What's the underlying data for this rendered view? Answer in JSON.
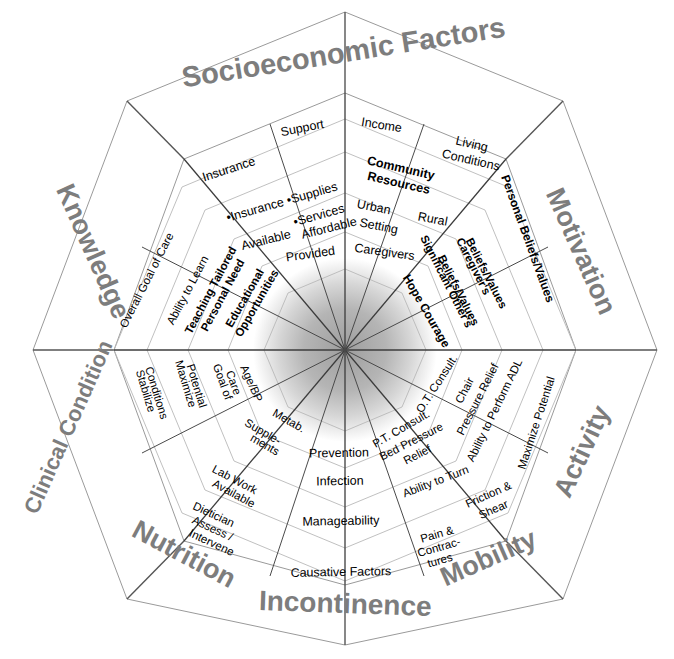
{
  "diagram": {
    "shape": "octagon",
    "center": {
      "x": 345,
      "y": 350
    },
    "colors": {
      "sector_title": "#7d7d7d",
      "cell_text": "#000000",
      "outer_line": "#9a9a9a",
      "divider_line": "#3c3c3c",
      "ring_line": "#b9b9b9",
      "hub_gradient_inner": "#a2a2a2",
      "hub_gradient_outer": "#ffffff",
      "background": "#ffffff"
    },
    "sectors": [
      {
        "id": "socioeconomic-factors",
        "title": "Socioeconomic Factors",
        "angle_deg": -90,
        "columns": [
          {
            "id": "socio-left",
            "cells": [
              "Insurance",
              "•Insurance •Supplies •Services",
              "Available",
              "Provided"
            ]
          },
          {
            "id": "socio-left-inner",
            "cells": [
              "Affordable"
            ]
          },
          {
            "id": "socio-right",
            "cells": [
              "Support",
              "Community Resources",
              "Urban Setting",
              "Caregivers"
            ]
          },
          {
            "id": "socio-right-outer",
            "cells": [
              "Income",
              "Living Conditions",
              "Rural"
            ]
          }
        ]
      },
      {
        "id": "motivation",
        "title": "Motivation",
        "angle_deg": -45,
        "columns": [
          {
            "id": "motivation-cells",
            "cells": [
              "Personal Beliefs/Values",
              "Caregiver's Beliefs/Values",
              "Significant Other's Beliefs/Values",
              "Hope Courage"
            ]
          }
        ]
      },
      {
        "id": "activity",
        "title": "Activity",
        "angle_deg": 0,
        "columns": [
          {
            "id": "activity-cells",
            "cells": [
              "Maximize Potential",
              "Ability to Perform ADL",
              "Chair Pressure Relief",
              "O.T. Consult."
            ]
          }
        ]
      },
      {
        "id": "mobility",
        "title": "Mobility",
        "angle_deg": 45,
        "columns": [
          {
            "id": "mobility-cells",
            "cells": [
              "Friction & Shear",
              "Ability to Turn",
              "Bed Pressure Relief",
              "P.T. Consult.",
              "Pain & Contrac-tures"
            ]
          }
        ]
      },
      {
        "id": "incontinence",
        "title": "Incontinence",
        "angle_deg": 90,
        "columns": [
          {
            "id": "incontinence-cells",
            "cells": [
              "Causative Factors",
              "Manageability",
              "Infection",
              "Prevention"
            ]
          }
        ]
      },
      {
        "id": "nutrition",
        "title": "Nutrition",
        "angle_deg": 135,
        "columns": [
          {
            "id": "nutrition-cells",
            "cells": [
              "Dietician Assess / Intervene",
              "Lab Work Available",
              "Supple-ments",
              "Metab."
            ]
          }
        ]
      },
      {
        "id": "clinical-condition",
        "title": "Clinical Condition",
        "angle_deg": 180,
        "columns": [
          {
            "id": "clinical-cells",
            "cells": [
              "Stabilize Conditions",
              "Maximize Potential",
              "Goal of Care",
              "Age/BP"
            ]
          }
        ]
      },
      {
        "id": "knowledge",
        "title": "Knowledge",
        "angle_deg": -135,
        "columns": [
          {
            "id": "knowledge-cells",
            "cells": [
              "Overall Goal of Care",
              "Ability to Learn",
              "Teaching Tailored Personal Need",
              "Educational Opportunities"
            ]
          }
        ]
      }
    ]
  },
  "labels": {
    "socioeconomic_factors": "Socioeconomic Factors",
    "motivation": "Motivation",
    "activity": "Activity",
    "mobility": "Mobility",
    "incontinence": "Incontinence",
    "nutrition": "Nutrition",
    "clinical_condition": "Clinical Condition",
    "knowledge": "Knowledge",
    "socio_insurance": "Insurance",
    "socio_bullets": "•Insurance •Supplies",
    "socio_bullets2": "•Services",
    "socio_available": "Available",
    "socio_affordable": "Affordable",
    "socio_provided": "Provided",
    "socio_support": "Support",
    "socio_income": "Income",
    "socio_living": "Living",
    "socio_conditions": "Conditions",
    "socio_community": "Community",
    "socio_resources": "Resources",
    "socio_urban": "Urban",
    "socio_setting": "Setting",
    "socio_rural": "Rural",
    "socio_caregivers": "Caregivers",
    "mot_personal": "Personal Beliefs/Values",
    "mot_caregiver1": "Caregiver's",
    "mot_caregiver2": "Beliefs/Values",
    "mot_signif1": "Significant Other's",
    "mot_signif2": "Beliefs/Values",
    "mot_hope": "Hope Courage",
    "act_maximize": "Maximize Potential",
    "act_adl": "Ability to Perform ADL",
    "act_chair1": "Chair",
    "act_chair2": "Pressure Relief",
    "act_ot": "O.T. Consult.",
    "mob_friction1": "Friction &",
    "mob_friction2": "Shear",
    "mob_turn": "Ability to Turn",
    "mob_bed1": "Bed Pressure",
    "mob_bed2": "Relief",
    "mob_pt": "P.T. Consult.",
    "mob_pain1": "Pain &",
    "mob_pain2": "Contrac-",
    "mob_pain3": "tures",
    "inc_causative": "Causative Factors",
    "inc_manage": "Manageability",
    "inc_infection": "Infection",
    "inc_prevention": "Prevention",
    "nut_diet1": "Dietician",
    "nut_diet2": "Assess /",
    "nut_diet3": "Intervene",
    "nut_lab1": "Lab Work",
    "nut_lab2": "Available",
    "nut_supp1": "Supple-",
    "nut_supp2": "ments",
    "nut_metab": "Metab.",
    "cli_stabilize1": "Stabilize",
    "cli_stabilize2": "Conditions",
    "cli_maximize1": "Maximize",
    "cli_maximize2": "Potential",
    "cli_goal1": "Goal of",
    "cli_goal2": "Care",
    "cli_age": "Age/BP",
    "kno_overall": "Overall Goal of Care",
    "kno_learn": "Ability to Learn",
    "kno_teach1": "Teaching Tailored",
    "kno_teach2": "Personal Need",
    "kno_edu1": "Educational",
    "kno_edu2": "Opportunities"
  }
}
